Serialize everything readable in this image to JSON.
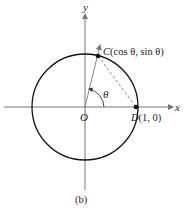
{
  "diagram": {
    "axes": {
      "x_label": "x",
      "y_label": "y",
      "origin_label": "O"
    },
    "points": {
      "C": {
        "name": "C",
        "coords": "(cos θ, sin θ)"
      },
      "D": {
        "name": "D",
        "coords": "(1, 0)"
      }
    },
    "angle_label": "θ",
    "caption": "(b)",
    "colors": {
      "circle": "#111111",
      "axes": "#777777",
      "chord": "#888888"
    }
  }
}
